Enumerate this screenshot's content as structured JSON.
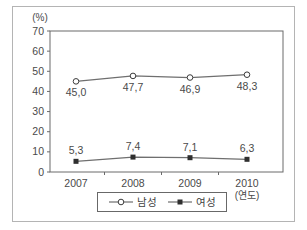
{
  "chart_data": {
    "type": "line",
    "title": "",
    "y_axis_unit_label": "(%)",
    "x_axis_unit_label": "(연도)",
    "categories": [
      "2007",
      "2008",
      "2009",
      "2010"
    ],
    "y_ticks": [
      0,
      10,
      20,
      30,
      40,
      50,
      60,
      70
    ],
    "ylim": [
      0,
      70
    ],
    "grid": false,
    "legend_position": "bottom-center",
    "series": [
      {
        "key": "male",
        "name": "남성",
        "marker": "open-circle",
        "values": [
          45.0,
          47.7,
          46.9,
          48.3
        ],
        "value_labels": [
          "45,0",
          "47,7",
          "46,9",
          "48,3"
        ],
        "label_position": "below"
      },
      {
        "key": "female",
        "name": "여성",
        "marker": "filled-square",
        "values": [
          5.3,
          7.4,
          7.1,
          6.3
        ],
        "value_labels": [
          "5,3",
          "7,4",
          "7,1",
          "6,3"
        ],
        "label_position": "above"
      }
    ],
    "colors": {
      "line": "#6f6f6f",
      "marker_stroke": "#3c3c3c",
      "marker_open_fill": "#ffffff",
      "marker_solid_fill": "#2f2f2f",
      "axis": "#6a6a6a",
      "text": "#4a4a4a",
      "outer_border": "#b4b4b4"
    }
  }
}
